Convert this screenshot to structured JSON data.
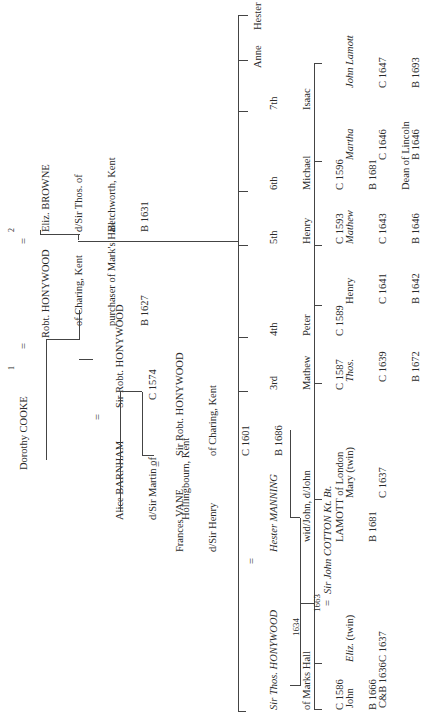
{
  "tree": {
    "gen1": {
      "wife1_number": "1",
      "wife1": "Dorothy COOKE",
      "eq1": "=",
      "husband": [
        "Robt. HONYWOOD",
        "of Charing, Kent",
        "purchaser of Mark's Hall",
        "B 1627"
      ],
      "eq2": "=",
      "wife2_number": "2",
      "wife2": [
        "Eliz. BROWNE",
        "d/Sir Thos. of",
        "Betchworth, Kent",
        "B 1631"
      ]
    },
    "gen2_line1": {
      "wife": [
        "Alice BARNHAM",
        "d/Sir Martin of",
        "Hollingbourn, Kent"
      ],
      "eq": "=",
      "husband": [
        "Sir Robt. HONYWOOD",
        "C 1574"
      ]
    },
    "gen3_line1": {
      "wife": [
        "Frances VANE",
        "d/Sir Henry"
      ],
      "eq": "=",
      "husband": [
        "Sir Robt. HONYWOOD",
        "of Charing, Kent",
        "C 1601",
        "B 1686"
      ]
    },
    "gen2_main": {
      "husband_title": "Sir Thos.",
      "husband_name": "HONYWOOD",
      "husband_lines": [
        "of Marks Hall",
        "C 1586",
        "B 1666"
      ],
      "eq": "=",
      "wife_name": "Hester MANNING",
      "wife_lines": [
        "wid/John, d/John",
        "LAMOTT of London",
        "B 1681"
      ],
      "marriage_year": "1634"
    },
    "siblings": [
      {
        "ordinal": "3rd",
        "name": "Mathew",
        "dates": [
          "C 1587"
        ]
      },
      {
        "ordinal": "4th",
        "name": "Peter",
        "dates": [
          "C 1589"
        ]
      },
      {
        "ordinal": "5th",
        "name": "Henry",
        "dates": [
          "C 1593"
        ]
      },
      {
        "ordinal": "6th",
        "name": "Michael",
        "dates": [
          "C 1596",
          "B 1681",
          "Dean of Lincoln"
        ]
      },
      {
        "ordinal": "7th",
        "name": "Isaac",
        "dates": []
      },
      {
        "ordinal": "",
        "name": "Anne",
        "dates": []
      },
      {
        "ordinal": "",
        "name": "Hester",
        "dates": []
      }
    ],
    "gen3_main": {
      "children": [
        {
          "name": "John",
          "dates": [
            "C&B 1636"
          ],
          "italic": false
        },
        {
          "name": "Eliz.",
          "suffix": "(twin)",
          "dates": [
            "C 1637"
          ],
          "italic": true
        },
        {
          "name": "Mary (twin)",
          "dates": [
            "C 1637"
          ],
          "italic": false
        },
        {
          "name": "Thos.",
          "dates": [
            "C 1639",
            "B 1672"
          ],
          "italic": true
        },
        {
          "name": "Henry",
          "dates": [
            "C 1641",
            "B 1642"
          ],
          "italic": false
        },
        {
          "name": "Mathew",
          "dates": [
            "C 1643",
            "B 1646"
          ],
          "italic": true
        },
        {
          "name": "Martha",
          "dates": [
            "C 1646",
            "B 1646"
          ],
          "italic": true
        },
        {
          "name": "John Lamott",
          "dates": [
            "C 1647",
            "B 1693"
          ],
          "italic": true
        }
      ],
      "eliz_marriage_year": "1663",
      "eliz_eq": "=",
      "eliz_spouse": "Sir John COTTON Kt. Bt."
    }
  }
}
